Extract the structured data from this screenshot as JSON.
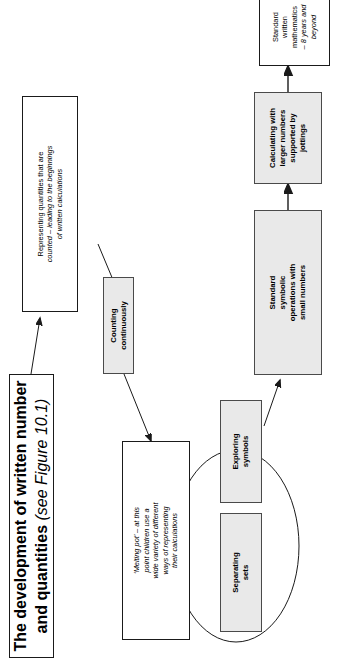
{
  "figure": {
    "title_node": {
      "heading": "The development of written number and quantities",
      "note": "(see Figure 10.1)"
    },
    "nodes": [
      {
        "id": "representing-quantities",
        "line1": "Representing quantities that are",
        "line2": "counted – leading to the beginnings\nof written calculations",
        "style": "white"
      },
      {
        "id": "counting-continuously",
        "label": "Counting\ncontinuously",
        "style": "shaded"
      },
      {
        "id": "melting-pot",
        "label": "‘Melting pot’ – at this\npoint children use a\nwide variety of different\nways of representing\ntheir calculations",
        "style": "white"
      },
      {
        "id": "separating-sets",
        "label": "Separating\nsets",
        "style": "shaded"
      },
      {
        "id": "exploring-symbols",
        "label": "Exploring\nsymbols",
        "style": "shaded"
      },
      {
        "id": "standard-symbolic-operations",
        "label": "Standard\nsymbolic\noperations with\nsmall numbers",
        "style": "shaded"
      },
      {
        "id": "calculating-larger-numbers",
        "label": "Calculating with\nlarger numbers\nsupported by\njottings",
        "style": "shaded"
      },
      {
        "id": "standard-written-mathematics",
        "line1": "Standard\nwritten\nmathematics",
        "line2": "– 8 years and\nbeyond",
        "style": "white"
      }
    ],
    "colors": {
      "shaded_fill": "#e9e9e9",
      "stroke": "#1a1a1a",
      "page_background": "#ffffff"
    }
  }
}
